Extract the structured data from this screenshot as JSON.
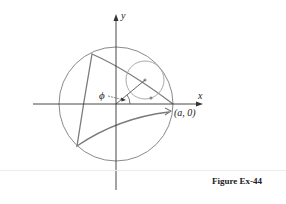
{
  "figure": {
    "caption": "Figure Ex-44",
    "labels": {
      "x_axis": "x",
      "y_axis": "y",
      "angle": "ϕ",
      "point": "(a, 0)"
    },
    "colors": {
      "curve": "#7a7a7a",
      "axes": "#333333",
      "text": "#222222",
      "divider": "#ececec"
    },
    "elements": {
      "outer_circle": "circle of radius a centered at origin",
      "rolling_circle": "small circle rolling inside outer circle",
      "curve": "three-cusped hypocycloid (deltoid)",
      "radius_line": "segment from origin at angle ϕ to center of rolling circle"
    }
  }
}
